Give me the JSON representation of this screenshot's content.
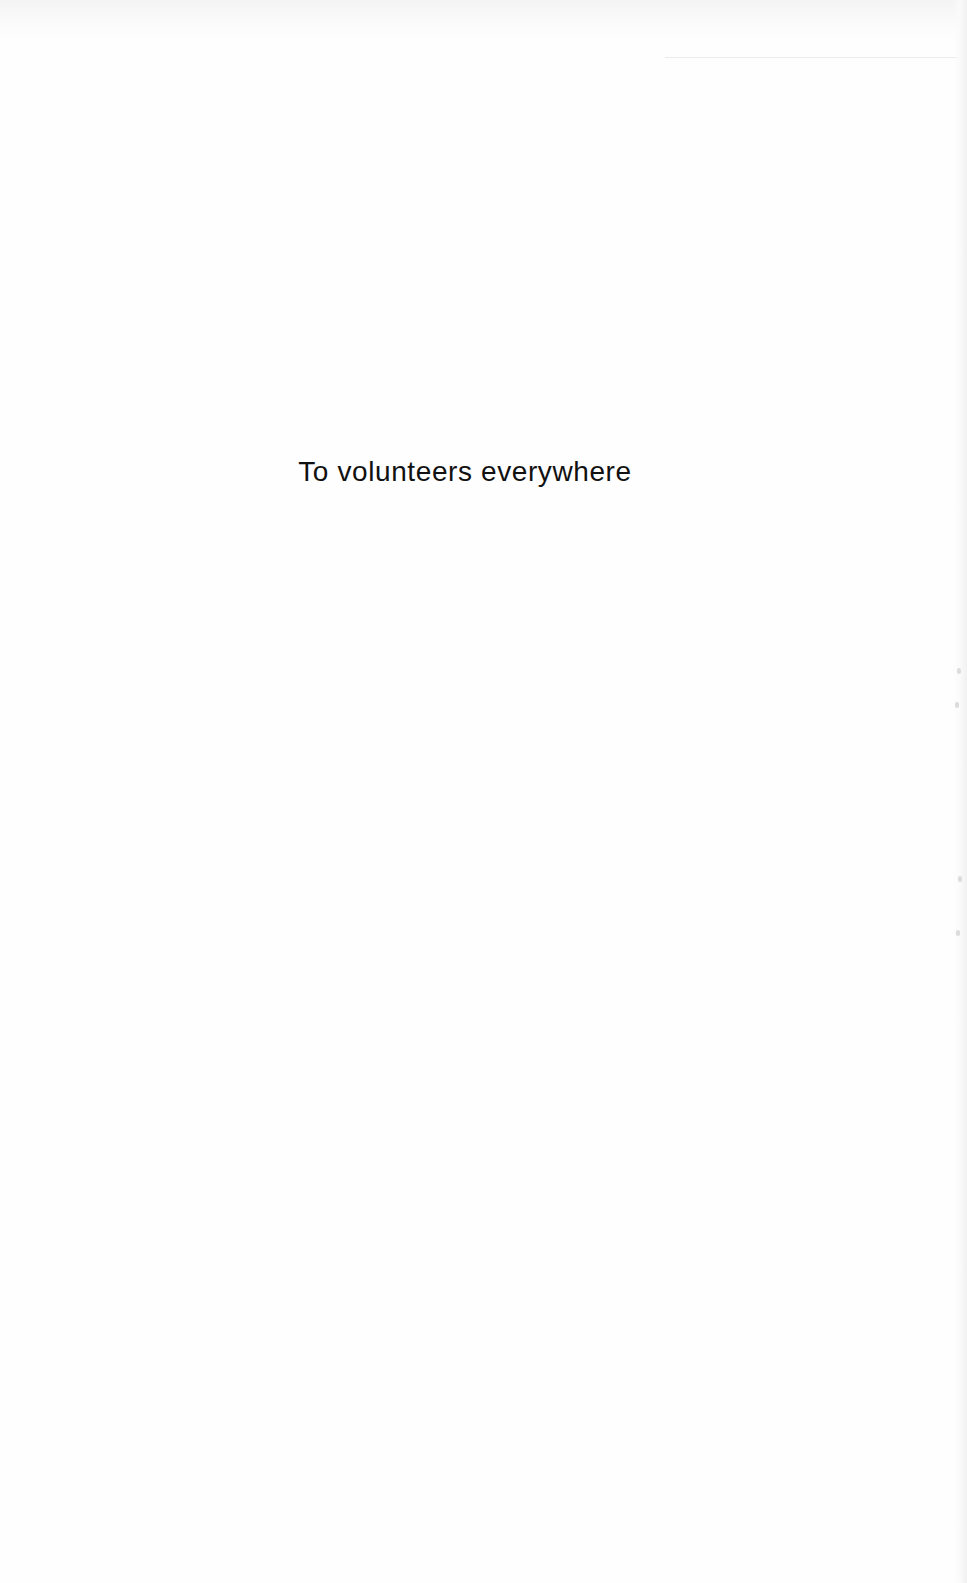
{
  "page": {
    "type": "dedication",
    "dedication_text": "To volunteers everywhere",
    "colors": {
      "background": "#fefefe",
      "text": "#111111"
    }
  }
}
